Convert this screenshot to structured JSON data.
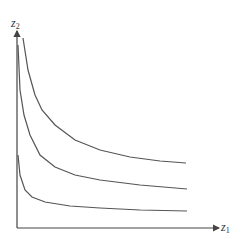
{
  "diagram": {
    "title": "",
    "axes": {
      "y_label": {
        "base": "z",
        "sub": "2"
      },
      "x_label": {
        "base": "z",
        "sub": "1"
      }
    },
    "curves": [
      {
        "name": "upper-curve",
        "points": [
          [
            23,
            38
          ],
          [
            28,
            70
          ],
          [
            35,
            95
          ],
          [
            42,
            110
          ],
          [
            55,
            125
          ],
          [
            75,
            140
          ],
          [
            100,
            150
          ],
          [
            130,
            157
          ],
          [
            160,
            161
          ],
          [
            186,
            163
          ]
        ]
      },
      {
        "name": "middle-curve",
        "points": [
          [
            18,
            45
          ],
          [
            20,
            90
          ],
          [
            24,
            115
          ],
          [
            30,
            135
          ],
          [
            40,
            155
          ],
          [
            55,
            167
          ],
          [
            75,
            175
          ],
          [
            100,
            180
          ],
          [
            140,
            185
          ],
          [
            187,
            189
          ]
        ]
      },
      {
        "name": "lower-curve",
        "points": [
          [
            18,
            155
          ],
          [
            20,
            175
          ],
          [
            25,
            190
          ],
          [
            32,
            197
          ],
          [
            45,
            202
          ],
          [
            70,
            206
          ],
          [
            100,
            208
          ],
          [
            140,
            210
          ],
          [
            187,
            211
          ]
        ]
      }
    ],
    "colors": {
      "line": "#555555",
      "axis": "#444444"
    }
  }
}
